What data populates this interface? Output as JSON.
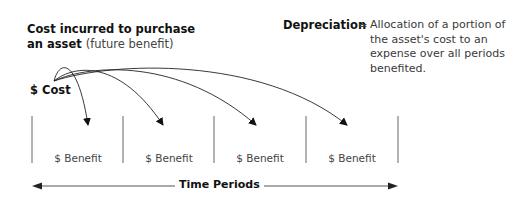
{
  "header": {
    "title_bold_line1": "Cost incurred to purchase",
    "title_bold_line2": "an asset",
    "title_light": "(future benefit)"
  },
  "definition": {
    "term": "Depreciation",
    "equals": "=",
    "text": "Allocation of a portion of the asset's cost to an expense over all periods benefited."
  },
  "cost_label": "$ Cost",
  "periods": [
    {
      "label": "$ Benefit"
    },
    {
      "label": "$ Benefit"
    },
    {
      "label": "$ Benefit"
    },
    {
      "label": "$ Benefit"
    }
  ],
  "axis": {
    "label": "Time Periods"
  }
}
